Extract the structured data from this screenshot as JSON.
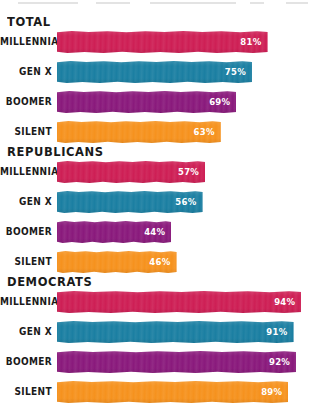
{
  "chart_data": {
    "type": "bar",
    "orientation": "horizontal",
    "title": "",
    "xlabel": "",
    "ylabel": "",
    "xlim": [
      0,
      100
    ],
    "grid": false,
    "legend": "none",
    "value_suffix": "%",
    "categories": [
      "MILLENNIAL",
      "GEN X",
      "BOOMER",
      "SILENT"
    ],
    "category_colors": [
      "#CE1F55",
      "#1B7FA2",
      "#8A1A7C",
      "#F6921E"
    ],
    "groups": [
      {
        "name": "TOTAL",
        "values": [
          81,
          75,
          69,
          63
        ],
        "labels": [
          "81%",
          "75%",
          "69%",
          "63%"
        ]
      },
      {
        "name": "REPUBLICANS",
        "values": [
          57,
          56,
          44,
          46
        ],
        "labels": [
          "57%",
          "56%",
          "44%",
          "46%"
        ]
      },
      {
        "name": "DEMOCRATS",
        "values": [
          94,
          91,
          92,
          89
        ],
        "labels": [
          "94%",
          "91%",
          "92%",
          "89%"
        ]
      }
    ]
  },
  "colors": {
    "millennial": "#CE1F55",
    "gen_x": "#1B7FA2",
    "boomer": "#8A1A7C",
    "silent": "#F6921E",
    "text": "#1A1A1A",
    "value_text": "#FFFFFF",
    "background": "#FFFFFF"
  }
}
